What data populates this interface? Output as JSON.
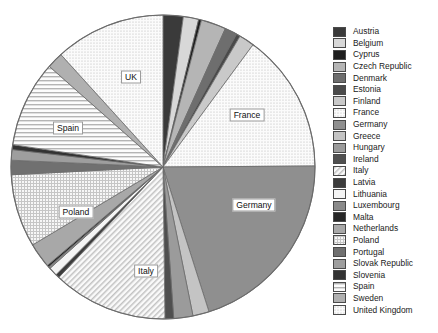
{
  "chart_data": {
    "type": "pie",
    "title": "",
    "legend_position": "right",
    "categories": [
      "Austria",
      "Belgium",
      "Cyprus",
      "Czech Republic",
      "Denmark",
      "Estonia",
      "Finland",
      "France",
      "Germany",
      "Greece",
      "Hungary",
      "Ireland",
      "Italy",
      "Latvia",
      "Lithuania",
      "Luxembourg",
      "Malta",
      "Netherlands",
      "Poland",
      "Portugal",
      "Slovak Republic",
      "Slovenia",
      "Spain",
      "Sweden",
      "United Kingdom"
    ],
    "values": [
      2.1,
      1.6,
      0.3,
      2.6,
      1.3,
      0.4,
      1.6,
      14.5,
      19.8,
      1.7,
      2.0,
      0.9,
      12.0,
      0.4,
      0.9,
      0.2,
      0.2,
      2.6,
      7.6,
      1.5,
      1.1,
      0.5,
      9.0,
      1.7,
      11.5
    ],
    "labels_shown": [
      "UK",
      "France",
      "Germany",
      "Italy",
      "Poland",
      "Spain"
    ],
    "start_angle_deg": 0,
    "direction": "clockwise"
  },
  "slices": [
    {
      "name": "Austria",
      "value": 2.1,
      "fill": "#3a3a3a",
      "pattern": "solid"
    },
    {
      "name": "Belgium",
      "value": 1.6,
      "fill": "#d8d8d8",
      "pattern": "solid"
    },
    {
      "name": "Cyprus",
      "value": 0.3,
      "fill": "#1e1e1e",
      "pattern": "solid"
    },
    {
      "name": "Czech Republic",
      "value": 2.6,
      "fill": "#b5b5b5",
      "pattern": "solid"
    },
    {
      "name": "Denmark",
      "value": 1.3,
      "fill": "#6e6e6e",
      "pattern": "solid"
    },
    {
      "name": "Estonia",
      "value": 0.4,
      "fill": "#4a4a4a",
      "pattern": "solid"
    },
    {
      "name": "Finland",
      "value": 1.6,
      "fill": "#c9c9c9",
      "pattern": "solid"
    },
    {
      "name": "France",
      "value": 14.5,
      "fill": "#e9e9e9",
      "pattern": "dots"
    },
    {
      "name": "Germany",
      "value": 19.8,
      "fill": "#8f8f8f",
      "pattern": "solid"
    },
    {
      "name": "Greece",
      "value": 1.7,
      "fill": "#c4c4c4",
      "pattern": "solid"
    },
    {
      "name": "Hungary",
      "value": 2.0,
      "fill": "#9b9b9b",
      "pattern": "solid"
    },
    {
      "name": "Ireland",
      "value": 0.9,
      "fill": "#4f4f4f",
      "pattern": "solid"
    },
    {
      "name": "Italy",
      "value": 12.0,
      "fill": "#ededed",
      "pattern": "diag"
    },
    {
      "name": "Latvia",
      "value": 0.4,
      "fill": "#3c3c3c",
      "pattern": "solid"
    },
    {
      "name": "Lithuania",
      "value": 0.9,
      "fill": "#f4f4f4",
      "pattern": "solid"
    },
    {
      "name": "Luxembourg",
      "value": 0.2,
      "fill": "#8a8a8a",
      "pattern": "solid"
    },
    {
      "name": "Malta",
      "value": 0.2,
      "fill": "#262626",
      "pattern": "solid"
    },
    {
      "name": "Netherlands",
      "value": 2.6,
      "fill": "#a8a8a8",
      "pattern": "solid"
    },
    {
      "name": "Poland",
      "value": 7.6,
      "fill": "#e0e0e0",
      "pattern": "grid"
    },
    {
      "name": "Portugal",
      "value": 1.5,
      "fill": "#707070",
      "pattern": "solid"
    },
    {
      "name": "Slovak Republic",
      "value": 1.1,
      "fill": "#9e9e9e",
      "pattern": "solid"
    },
    {
      "name": "Slovenia",
      "value": 0.5,
      "fill": "#333333",
      "pattern": "solid"
    },
    {
      "name": "Spain",
      "value": 9.0,
      "fill": "#f0f0f0",
      "pattern": "hlines"
    },
    {
      "name": "Sweden",
      "value": 1.7,
      "fill": "#b0b0b0",
      "pattern": "solid"
    },
    {
      "name": "United Kingdom",
      "value": 11.5,
      "fill": "#f6f6f6",
      "pattern": "dots"
    }
  ],
  "legend": {
    "items": [
      {
        "label": "Austria",
        "fill": "#3a3a3a",
        "pattern": "solid"
      },
      {
        "label": "Belgium",
        "fill": "#d8d8d8",
        "pattern": "solid"
      },
      {
        "label": "Cyprus",
        "fill": "#1e1e1e",
        "pattern": "solid"
      },
      {
        "label": "Czech Republic",
        "fill": "#b5b5b5",
        "pattern": "solid"
      },
      {
        "label": "Denmark",
        "fill": "#6e6e6e",
        "pattern": "solid"
      },
      {
        "label": "Estonia",
        "fill": "#4a4a4a",
        "pattern": "solid"
      },
      {
        "label": "Finland",
        "fill": "#c9c9c9",
        "pattern": "solid"
      },
      {
        "label": "France",
        "fill": "#e9e9e9",
        "pattern": "dots"
      },
      {
        "label": "Germany",
        "fill": "#8f8f8f",
        "pattern": "solid"
      },
      {
        "label": "Greece",
        "fill": "#c4c4c4",
        "pattern": "solid"
      },
      {
        "label": "Hungary",
        "fill": "#9b9b9b",
        "pattern": "solid"
      },
      {
        "label": "Ireland",
        "fill": "#4f4f4f",
        "pattern": "solid"
      },
      {
        "label": "Italy",
        "fill": "#ededed",
        "pattern": "diag"
      },
      {
        "label": "Latvia",
        "fill": "#3c3c3c",
        "pattern": "solid"
      },
      {
        "label": "Lithuania",
        "fill": "#f4f4f4",
        "pattern": "solid"
      },
      {
        "label": "Luxembourg",
        "fill": "#8a8a8a",
        "pattern": "solid"
      },
      {
        "label": "Malta",
        "fill": "#262626",
        "pattern": "solid"
      },
      {
        "label": "Netherlands",
        "fill": "#a8a8a8",
        "pattern": "solid"
      },
      {
        "label": "Poland",
        "fill": "#e0e0e0",
        "pattern": "grid"
      },
      {
        "label": "Portugal",
        "fill": "#707070",
        "pattern": "solid"
      },
      {
        "label": "Slovak Republic",
        "fill": "#9e9e9e",
        "pattern": "solid"
      },
      {
        "label": "Slovenia",
        "fill": "#333333",
        "pattern": "solid"
      },
      {
        "label": "Spain",
        "fill": "#f0f0f0",
        "pattern": "hlines"
      },
      {
        "label": "Sweden",
        "fill": "#b0b0b0",
        "pattern": "solid"
      },
      {
        "label": "United Kingdom",
        "fill": "#f6f6f6",
        "pattern": "dots"
      }
    ]
  },
  "callouts": [
    {
      "text": "UK",
      "x": 131,
      "y": 77
    },
    {
      "text": "France",
      "x": 247,
      "y": 115
    },
    {
      "text": "Germany",
      "x": 254,
      "y": 205
    },
    {
      "text": "Italy",
      "x": 146,
      "y": 271
    },
    {
      "text": "Poland",
      "x": 76,
      "y": 212
    },
    {
      "text": "Spain",
      "x": 68,
      "y": 128
    }
  ],
  "geometry": {
    "cx": 163,
    "cy": 167,
    "r": 152,
    "stroke": "#6b6b6b"
  }
}
